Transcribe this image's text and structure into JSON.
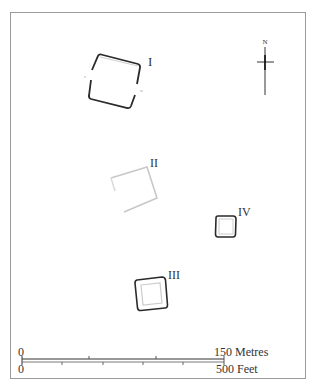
{
  "diagram": {
    "type": "site-plan",
    "enclosures": [
      {
        "id": "I",
        "label": "I",
        "style": "solid-dark"
      },
      {
        "id": "II",
        "label": "II",
        "style": "faint"
      },
      {
        "id": "III",
        "label": "III",
        "style": "solid-dark-with-inner"
      },
      {
        "id": "IV",
        "label": "IV",
        "style": "solid-dark-with-inner"
      }
    ],
    "north_arrow": {
      "label": "N",
      "icon": "north-arrow-icon"
    },
    "scale": {
      "metres": {
        "start": "0",
        "end": "150 Metres"
      },
      "feet": {
        "start": "0",
        "end": "500 Feet"
      }
    }
  },
  "colors": {
    "background": "#ffffff",
    "frame": "#9a9a9a",
    "dark_line": "#2a2a2a",
    "faint_line": "#c8c8c8",
    "text": "#333333"
  }
}
